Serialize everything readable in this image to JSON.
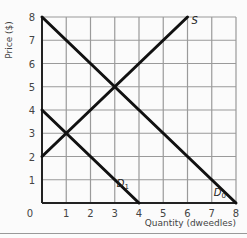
{
  "chart_data": {
    "type": "line",
    "title": "",
    "xlabel": "Quantity (dweedles)",
    "ylabel": "Price ($)",
    "xlim": [
      0,
      8
    ],
    "ylim": [
      0,
      8
    ],
    "grid": true,
    "xticks": [
      "0",
      "1",
      "2",
      "3",
      "4",
      "5",
      "6",
      "7",
      "8"
    ],
    "yticks": [
      "1",
      "2",
      "3",
      "4",
      "5",
      "6",
      "7",
      "8"
    ],
    "series": [
      {
        "name": "S",
        "label": "S",
        "points": [
          [
            0,
            2
          ],
          [
            6,
            8
          ]
        ]
      },
      {
        "name": "D0",
        "label": "D",
        "sub": "0",
        "points": [
          [
            0,
            8
          ],
          [
            8,
            0
          ]
        ]
      },
      {
        "name": "D1",
        "label": "D",
        "sub": "1",
        "points": [
          [
            0,
            4
          ],
          [
            4,
            0
          ]
        ]
      }
    ],
    "colors": {
      "lines": "#111111",
      "grid": "#9a9a9a",
      "axis": "#222222",
      "background": "#fbfbfb"
    }
  }
}
